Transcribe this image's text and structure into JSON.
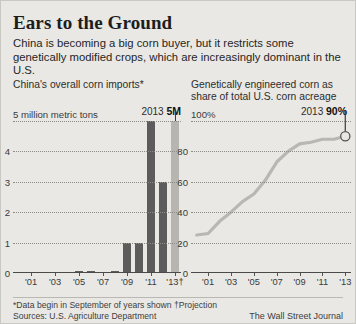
{
  "header": {
    "title": "Ears to the Ground",
    "deck": "China is becoming a big corn buyer, but it restricts some genetically modified crops, which are increasingly dominant in the U.S."
  },
  "footer": {
    "note": "*Data begin in September of years shown  †Projection",
    "sources": "Sources: U.S. Agriculture Department",
    "credit": "The Wall Street Journal"
  },
  "left_panel": {
    "subtitle": "China's overall corn imports*",
    "callout_year": "2013",
    "callout_value": "5M"
  },
  "right_panel": {
    "subtitle": "Genetically engineered corn as share of total U.S. corn acreage",
    "callout_year": "2013",
    "callout_value": "90%"
  },
  "colors": {
    "background": "#e9e8e4",
    "bar": "#5c5c5c",
    "bar_projection": "#b6b5b0",
    "line": "#b8b7b2",
    "axis": "#4a4a4a",
    "grid": "#8d8d88"
  },
  "chart_data": [
    {
      "type": "bar",
      "title": "China's overall corn imports*",
      "xlabel": "",
      "ylabel": "million metric tons",
      "ylim": [
        0,
        5
      ],
      "yticks": [
        0,
        1,
        2,
        3,
        4,
        5
      ],
      "ytick_labels": [
        "0",
        "1",
        "2",
        "3",
        "4",
        "5 million metric tons"
      ],
      "grid": true,
      "legend": "none",
      "categories": [
        "2000",
        "2001",
        "2002",
        "2003",
        "2004",
        "2005",
        "2006",
        "2007",
        "2008",
        "2009",
        "2010",
        "2011",
        "2012",
        "2013"
      ],
      "xtick_labels": [
        "'01",
        "'03",
        "'05",
        "'07",
        "'09",
        "'11",
        "'13†"
      ],
      "values": [
        0.03,
        0.04,
        0.01,
        0.01,
        0.01,
        0.06,
        0.06,
        0.01,
        0.05,
        1.0,
        1.0,
        5.0,
        3.0,
        5.0
      ],
      "projection_index": 13,
      "annotation": {
        "year": "2013",
        "value": "5M"
      }
    },
    {
      "type": "line",
      "title": "Genetically engineered corn as share of total U.S. corn acreage",
      "xlabel": "",
      "ylabel": "percent of acreage",
      "ylim": [
        0,
        100
      ],
      "yticks": [
        0,
        20,
        40,
        60,
        80,
        100
      ],
      "ytick_labels": [
        "0",
        "20",
        "40",
        "60",
        "80",
        "100%"
      ],
      "grid": true,
      "legend": "none",
      "x": [
        "2000",
        "2001",
        "2002",
        "2003",
        "2004",
        "2005",
        "2006",
        "2007",
        "2008",
        "2009",
        "2010",
        "2011",
        "2012",
        "2013"
      ],
      "xtick_labels": [
        "'01",
        "'03",
        "'05",
        "'07",
        "'09",
        "'11",
        "'13"
      ],
      "values": [
        25,
        26,
        34,
        40,
        47,
        52,
        61,
        73,
        80,
        85,
        86,
        88,
        88,
        90
      ],
      "endpoint_marker": {
        "x": "2013",
        "y": 90,
        "style": "open-circle"
      },
      "annotation": {
        "year": "2013",
        "value": "90%"
      }
    }
  ]
}
